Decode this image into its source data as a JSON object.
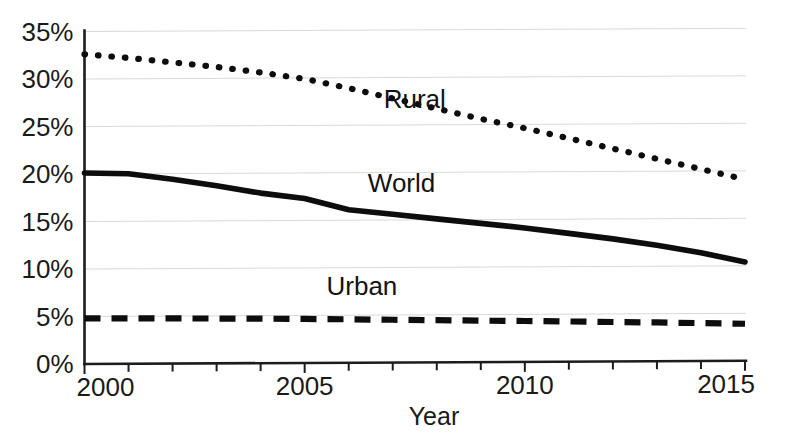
{
  "chart_data": {
    "type": "line",
    "title": "",
    "subtitle": "",
    "xlabel": "Year",
    "ylabel": "",
    "xlim": [
      2000,
      2015
    ],
    "ylim": [
      0,
      35
    ],
    "grid": true,
    "legend_position": "inline-annotations",
    "x": [
      2000,
      2001,
      2002,
      2003,
      2004,
      2005,
      2006,
      2007,
      2008,
      2009,
      2010,
      2011,
      2012,
      2013,
      2014,
      2015
    ],
    "x_tick_labels": [
      "2000",
      "2005",
      "2010",
      "2015"
    ],
    "x_tick_values": [
      2000,
      2005,
      2010,
      2015
    ],
    "x_minor_tick_values": [
      2000,
      2001,
      2002,
      2003,
      2004,
      2005,
      2006,
      2007,
      2008,
      2009,
      2010,
      2011,
      2012,
      2013,
      2014,
      2015
    ],
    "y_tick_labels": [
      "0%",
      "5%",
      "10%",
      "15%",
      "20%",
      "25%",
      "30%",
      "35%"
    ],
    "y_tick_values": [
      0,
      5,
      10,
      15,
      20,
      25,
      30,
      35
    ],
    "series": [
      {
        "name": "Rural",
        "style": "dotted",
        "color": "#0d0d0d",
        "label_x": 2007.5,
        "label_y": 26.8,
        "values": [
          32.6,
          32.2,
          31.7,
          31.2,
          30.6,
          29.9,
          28.9,
          27.8,
          26.7,
          25.6,
          24.6,
          23.5,
          22.4,
          21.3,
          20.2,
          19.1
        ]
      },
      {
        "name": "World",
        "style": "solid",
        "color": "#0d0d0d",
        "label_x": 2007.2,
        "label_y": 17.9,
        "values": [
          20.1,
          20.0,
          19.4,
          18.7,
          17.9,
          17.3,
          16.1,
          15.6,
          15.1,
          14.6,
          14.1,
          13.5,
          12.9,
          12.2,
          11.4,
          10.4
        ]
      },
      {
        "name": "Urban",
        "style": "dashed",
        "color": "#0d0d0d",
        "label_x": 2006.3,
        "label_y": 7.1,
        "values": [
          4.8,
          4.78,
          4.75,
          4.72,
          4.68,
          4.63,
          4.57,
          4.5,
          4.43,
          4.36,
          4.3,
          4.23,
          4.15,
          4.08,
          3.99,
          3.9
        ]
      }
    ]
  }
}
